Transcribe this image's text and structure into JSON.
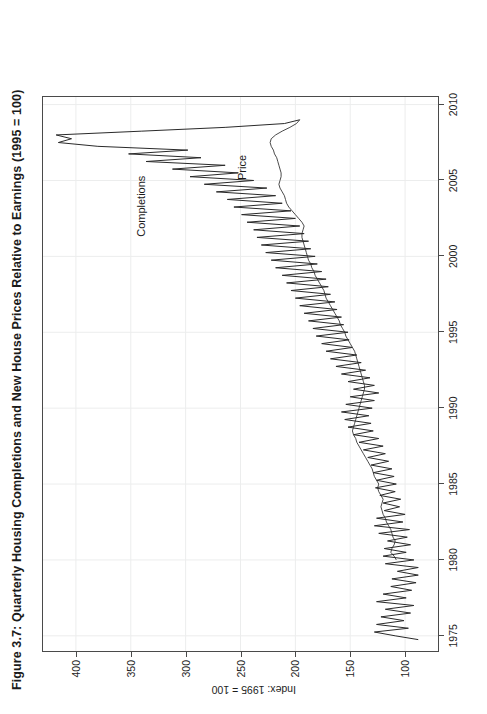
{
  "figure": {
    "title": "Figure 3.7: Quarterly Housing Completions and New House Prices Relative to Earnings (1995 = 100)",
    "orientation_note": "rotated-90-ccw"
  },
  "annotations": {
    "completions_label": "Completions",
    "price_label": "Price"
  },
  "chart_data": {
    "type": "line",
    "title": "Figure 3.7: Quarterly Housing Completions and New House Prices Relative to Earnings (1995 = 100)",
    "xlabel": "",
    "ylabel": "Index: 1995 = 100",
    "xlim": [
      1974.0,
      2010.5
    ],
    "ylim": [
      70,
      430
    ],
    "xticks": [
      1975,
      1980,
      1985,
      1990,
      1995,
      2000,
      2005,
      2010
    ],
    "xtick_labels": [
      "1975",
      "1980",
      "1985",
      "1990",
      "1995",
      "2000",
      "2005",
      "2010"
    ],
    "yticks": [
      100,
      150,
      200,
      250,
      300,
      350,
      400
    ],
    "ytick_labels": [
      "100",
      "150",
      "200",
      "250",
      "300",
      "350",
      "400"
    ],
    "grid": true,
    "legend": "inline-annotations",
    "frequency": "quarterly",
    "series": [
      {
        "name": "Completions",
        "color": "#2a2a2a",
        "linewidth": 1.0,
        "x": [
          1974.75,
          1975.0,
          1975.25,
          1975.5,
          1975.75,
          1976.0,
          1976.25,
          1976.5,
          1976.75,
          1977.0,
          1977.25,
          1977.5,
          1977.75,
          1978.0,
          1978.25,
          1978.5,
          1978.75,
          1979.0,
          1979.25,
          1979.5,
          1979.75,
          1980.0,
          1980.25,
          1980.5,
          1980.75,
          1981.0,
          1981.25,
          1981.5,
          1981.75,
          1982.0,
          1982.25,
          1982.5,
          1982.75,
          1983.0,
          1983.25,
          1983.5,
          1983.75,
          1984.0,
          1984.25,
          1984.5,
          1984.75,
          1985.0,
          1985.25,
          1985.5,
          1985.75,
          1986.0,
          1986.25,
          1986.5,
          1986.75,
          1987.0,
          1987.25,
          1987.5,
          1987.75,
          1988.0,
          1988.25,
          1988.5,
          1988.75,
          1989.0,
          1989.25,
          1989.5,
          1989.75,
          1990.0,
          1990.25,
          1990.5,
          1990.75,
          1991.0,
          1991.25,
          1991.5,
          1991.75,
          1992.0,
          1992.25,
          1992.5,
          1992.75,
          1993.0,
          1993.25,
          1993.5,
          1993.75,
          1994.0,
          1994.25,
          1994.5,
          1994.75,
          1995.0,
          1995.25,
          1995.5,
          1995.75,
          1996.0,
          1996.25,
          1996.5,
          1996.75,
          1997.0,
          1997.25,
          1997.5,
          1997.75,
          1998.0,
          1998.25,
          1998.5,
          1998.75,
          1999.0,
          1999.25,
          1999.5,
          1999.75,
          2000.0,
          2000.25,
          2000.5,
          2000.75,
          2001.0,
          2001.25,
          2001.5,
          2001.75,
          2002.0,
          2002.25,
          2002.5,
          2002.75,
          2003.0,
          2003.25,
          2003.5,
          2003.75,
          2004.0,
          2004.25,
          2004.5,
          2004.75,
          2005.0,
          2005.25,
          2005.5,
          2005.75,
          2006.0,
          2006.25,
          2006.5,
          2006.75,
          2007.0,
          2007.25,
          2007.5,
          2007.75,
          2008.0,
          2008.25,
          2008.5,
          2008.75,
          2009.0
        ],
        "values": [
          88,
          109,
          128,
          97,
          126,
          101,
          122,
          95,
          118,
          92,
          126,
          99,
          120,
          94,
          113,
          90,
          112,
          88,
          107,
          88,
          118,
          92,
          120,
          99,
          119,
          95,
          116,
          98,
          124,
          96,
          128,
          102,
          126,
          100,
          119,
          105,
          120,
          104,
          123,
          109,
          127,
          108,
          126,
          110,
          129,
          112,
          131,
          115,
          134,
          118,
          138,
          120,
          142,
          124,
          147,
          129,
          152,
          131,
          155,
          133,
          158,
          130,
          154,
          128,
          150,
          124,
          147,
          128,
          152,
          132,
          158,
          136,
          163,
          140,
          168,
          144,
          172,
          148,
          176,
          151,
          181,
          152,
          184,
          156,
          188,
          158,
          192,
          162,
          196,
          164,
          200,
          168,
          204,
          170,
          208,
          172,
          212,
          176,
          218,
          180,
          222,
          182,
          227,
          186,
          231,
          188,
          235,
          192,
          238,
          196,
          244,
          200,
          249,
          204,
          256,
          212,
          262,
          218,
          272,
          226,
          283,
          238,
          296,
          252,
          312,
          264,
          336,
          286,
          352,
          298,
          380,
          416,
          404,
          418,
          340,
          264,
          210,
          196
        ]
      },
      {
        "name": "Price",
        "color": "#2a2a2a",
        "linewidth": 0.85,
        "x": [
          1980.0,
          1980.25,
          1980.5,
          1980.75,
          1981.0,
          1981.25,
          1981.5,
          1981.75,
          1982.0,
          1982.25,
          1982.5,
          1982.75,
          1983.0,
          1983.25,
          1983.5,
          1983.75,
          1984.0,
          1984.25,
          1984.5,
          1984.75,
          1985.0,
          1985.25,
          1985.5,
          1985.75,
          1986.0,
          1986.25,
          1986.5,
          1986.75,
          1987.0,
          1987.25,
          1987.5,
          1987.75,
          1988.0,
          1988.25,
          1988.5,
          1988.75,
          1989.0,
          1989.25,
          1989.5,
          1989.75,
          1990.0,
          1990.25,
          1990.5,
          1990.75,
          1991.0,
          1991.25,
          1991.5,
          1991.75,
          1992.0,
          1992.25,
          1992.5,
          1992.75,
          1993.0,
          1993.25,
          1993.5,
          1993.75,
          1994.0,
          1994.25,
          1994.5,
          1994.75,
          1995.0,
          1995.25,
          1995.5,
          1995.75,
          1996.0,
          1996.25,
          1996.5,
          1996.75,
          1997.0,
          1997.25,
          1997.5,
          1997.75,
          1998.0,
          1998.25,
          1998.5,
          1998.75,
          1999.0,
          1999.25,
          1999.5,
          1999.75,
          2000.0,
          2000.25,
          2000.5,
          2000.75,
          2001.0,
          2001.25,
          2001.5,
          2001.75,
          2002.0,
          2002.25,
          2002.5,
          2002.75,
          2003.0,
          2003.25,
          2003.5,
          2003.75,
          2004.0,
          2004.25,
          2004.5,
          2004.75,
          2005.0,
          2005.25,
          2005.5,
          2005.75,
          2006.0,
          2006.25,
          2006.5,
          2006.75,
          2007.0,
          2007.25,
          2007.5,
          2007.75,
          2008.0,
          2008.25,
          2008.5,
          2008.75,
          2009.0
        ],
        "values": [
          108,
          110,
          113,
          112,
          110,
          109,
          111,
          112,
          113,
          115,
          117,
          118,
          120,
          121,
          122,
          121,
          120,
          122,
          124,
          125,
          124,
          126,
          128,
          129,
          130,
          132,
          134,
          136,
          138,
          140,
          142,
          144,
          145,
          147,
          148,
          147,
          146,
          145,
          144,
          143,
          142,
          141,
          140,
          139,
          138,
          137,
          137,
          138,
          139,
          140,
          141,
          142,
          143,
          144,
          145,
          146,
          148,
          150,
          152,
          154,
          155,
          157,
          159,
          160,
          162,
          164,
          166,
          168,
          170,
          172,
          173,
          174,
          176,
          178,
          180,
          182,
          183,
          185,
          186,
          188,
          189,
          190,
          191,
          192,
          193,
          194,
          194,
          193,
          192,
          194,
          197,
          200,
          203,
          206,
          208,
          209,
          210,
          212,
          214,
          215,
          214,
          213,
          213,
          214,
          215,
          216,
          217,
          219,
          220,
          222,
          223,
          222,
          218,
          212,
          205,
          199,
          196
        ]
      }
    ]
  }
}
